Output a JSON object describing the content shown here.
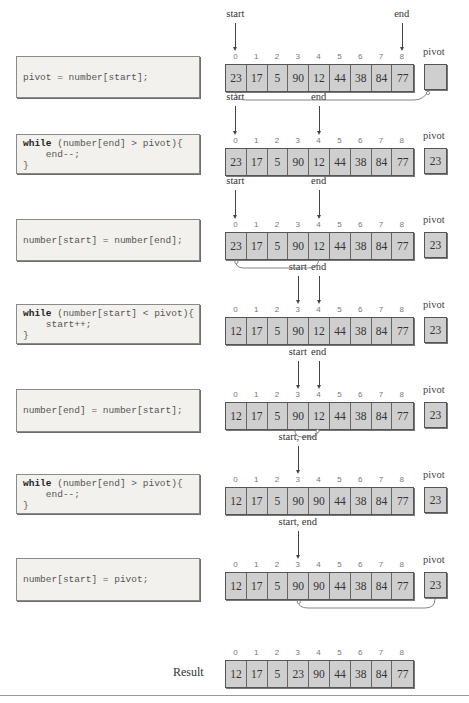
{
  "labels": {
    "pivot": "pivot",
    "result": "Result"
  },
  "indices": [
    "0",
    "1",
    "2",
    "3",
    "4",
    "5",
    "6",
    "7",
    "8"
  ],
  "steps": [
    {
      "code": [
        {
          "kw": "",
          "text": "pivot = number[start];"
        }
      ],
      "pointers": [
        {
          "label": "start",
          "index": 0
        },
        {
          "label": "end",
          "index": 8
        }
      ],
      "array": [
        "23",
        "17",
        "5",
        "90",
        "12",
        "44",
        "38",
        "84",
        "77"
      ],
      "pivot": "",
      "arrow": "array index 0 to pivot"
    },
    {
      "code": [
        {
          "kw": "while",
          "text": " (number[end] > pivot){"
        },
        {
          "kw": "",
          "text": "    end--;"
        },
        {
          "kw": "",
          "text": "}"
        }
      ],
      "pointers": [
        {
          "label": "start",
          "index": 0
        },
        {
          "label": "end",
          "index": 4
        }
      ],
      "array": [
        "23",
        "17",
        "5",
        "90",
        "12",
        "44",
        "38",
        "84",
        "77"
      ],
      "pivot": "23"
    },
    {
      "code": [
        {
          "kw": "",
          "text": "number[start] = number[end];"
        }
      ],
      "pointers": [
        {
          "label": "start",
          "index": 0
        },
        {
          "label": "end",
          "index": 4
        }
      ],
      "array": [
        "23",
        "17",
        "5",
        "90",
        "12",
        "44",
        "38",
        "84",
        "77"
      ],
      "pivot": "23",
      "arrow": "index 4 to index 0"
    },
    {
      "code": [
        {
          "kw": "while",
          "text": " (number[start] < pivot){"
        },
        {
          "kw": "",
          "text": "    start++;"
        },
        {
          "kw": "",
          "text": "}"
        }
      ],
      "pointers": [
        {
          "label": "start",
          "index": 3
        },
        {
          "label": "end",
          "index": 4
        }
      ],
      "array": [
        "12",
        "17",
        "5",
        "90",
        "12",
        "44",
        "38",
        "84",
        "77"
      ],
      "pivot": "23"
    },
    {
      "code": [
        {
          "kw": "",
          "text": "number[end] = number[start];"
        }
      ],
      "pointers": [
        {
          "label": "start",
          "index": 3
        },
        {
          "label": "end",
          "index": 4
        }
      ],
      "array": [
        "12",
        "17",
        "5",
        "90",
        "12",
        "44",
        "38",
        "84",
        "77"
      ],
      "pivot": "23",
      "arrow": "index 3 to index 4"
    },
    {
      "code": [
        {
          "kw": "while",
          "text": " (number[end] > pivot){"
        },
        {
          "kw": "",
          "text": "    end--;"
        },
        {
          "kw": "",
          "text": "}"
        }
      ],
      "pointers": [
        {
          "label": "start, end",
          "index": 3
        }
      ],
      "array": [
        "12",
        "17",
        "5",
        "90",
        "90",
        "44",
        "38",
        "84",
        "77"
      ],
      "pivot": "23"
    },
    {
      "code": [
        {
          "kw": "",
          "text": "number[start] = pivot;"
        }
      ],
      "pointers": [
        {
          "label": "start, end",
          "index": 3
        }
      ],
      "array": [
        "12",
        "17",
        "5",
        "90",
        "90",
        "44",
        "38",
        "84",
        "77"
      ],
      "pivot": "23",
      "arrow": "pivot to index 3"
    }
  ],
  "result": [
    "12",
    "17",
    "5",
    "23",
    "90",
    "44",
    "38",
    "84",
    "77"
  ]
}
